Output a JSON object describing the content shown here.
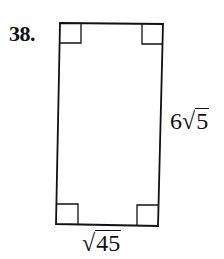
{
  "problem": {
    "number_label": "38.",
    "shape": "rectangle",
    "right_angle_marks": 4,
    "side_label": {
      "coefficient": "6",
      "radical_sign": "√",
      "radicand": "5"
    },
    "bottom_label": {
      "radical_sign": "√",
      "radicand": "45"
    }
  },
  "colors": {
    "stroke": "#111111",
    "background": "#ffffff"
  }
}
